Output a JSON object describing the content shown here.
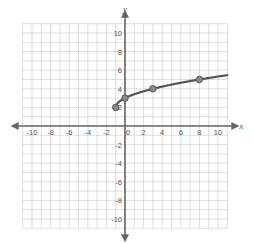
{
  "chart_data": {
    "type": "line",
    "title": "",
    "xlabel": "x",
    "ylabel": "y",
    "xlim": [
      -11,
      11
    ],
    "ylim": [
      -11,
      11
    ],
    "grid": true,
    "x_ticks": [
      -10,
      -8,
      -6,
      -4,
      -2,
      0,
      2,
      4,
      6,
      8,
      10
    ],
    "y_ticks": [
      -10,
      -8,
      -6,
      -4,
      -2,
      2,
      4,
      6,
      8,
      10
    ],
    "series": [
      {
        "name": "curve",
        "kind": "square-root",
        "start": [
          -1,
          2
        ],
        "end_x": 11,
        "points": [
          [
            -1,
            2
          ],
          [
            0,
            3
          ],
          [
            3,
            4
          ],
          [
            8,
            5
          ]
        ],
        "color": "#555555"
      }
    ],
    "legend": null
  },
  "colors": {
    "grid": "#c8c8c8",
    "axis": "#666666",
    "curve": "#555555",
    "point": "#8a8a8a"
  }
}
